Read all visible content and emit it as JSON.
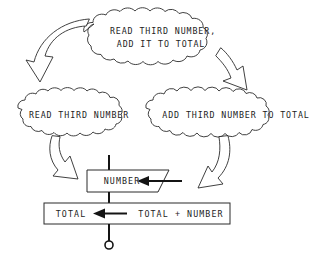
{
  "diagram": {
    "background_color": "#ffffff",
    "ink_color": "#1d1d1d",
    "nodes": {
      "top_cloud": {
        "shape": "cloud",
        "line1": "READ THIRD NUMBER,",
        "line2": "ADD IT TO TOTAL"
      },
      "left_cloud": {
        "shape": "cloud",
        "label": "READ THIRD NUMBER"
      },
      "right_cloud": {
        "shape": "cloud",
        "label": "ADD THIRD NUMBER TO TOTAL"
      },
      "number_box": {
        "shape": "input-parallelogram",
        "label": "NUMBER"
      },
      "total_box": {
        "shape": "rectangle",
        "assign_target": "TOTAL",
        "assign_operator": "←",
        "assign_expression": "TOTAL + NUMBER"
      },
      "terminator": {
        "shape": "open-circle",
        "label": ""
      }
    },
    "connectors": [
      {
        "name": "top-cloud-to-left-cloud",
        "style": "curved-block-arrow",
        "direction": "down-left"
      },
      {
        "name": "top-cloud-to-right-cloud",
        "style": "curved-block-arrow",
        "direction": "down-right"
      },
      {
        "name": "left-cloud-to-number-box",
        "style": "curved-block-arrow",
        "direction": "down-right"
      },
      {
        "name": "right-cloud-to-total-box",
        "style": "curved-block-arrow",
        "direction": "down-left"
      },
      {
        "name": "number-box-input-arrow",
        "style": "solid-arrow",
        "direction": "left"
      },
      {
        "name": "spine-top",
        "style": "solid-line",
        "direction": "down"
      },
      {
        "name": "spine-middle",
        "style": "solid-line",
        "direction": "down"
      },
      {
        "name": "spine-bottom",
        "style": "solid-line",
        "direction": "down"
      }
    ]
  }
}
